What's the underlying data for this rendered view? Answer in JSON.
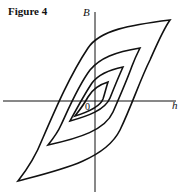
{
  "figure": {
    "title": "Figure 4",
    "y_axis_label": "B",
    "x_axis_label": "h",
    "origin_label": "0",
    "loop_count": 4,
    "line_color": "#111111"
  }
}
